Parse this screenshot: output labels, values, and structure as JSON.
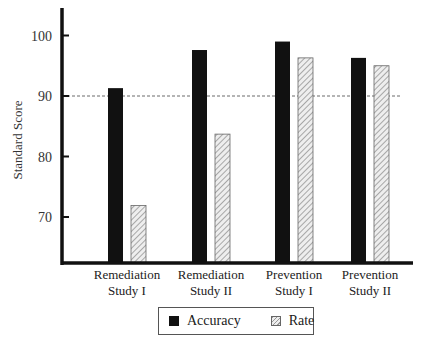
{
  "chart_data": {
    "type": "bar",
    "title": "",
    "xlabel": "",
    "ylabel": "Standard Score",
    "ylim": [
      62,
      104
    ],
    "yticks": [
      70,
      80,
      90,
      100
    ],
    "reference_line": {
      "value": 90,
      "style": "dashed"
    },
    "categories": [
      "Remediation Study I",
      "Remediation Study II",
      "Prevention Study I",
      "Prevention Study II"
    ],
    "category_lines": [
      [
        "Remediation",
        "Study I"
      ],
      [
        "Remediation",
        "Study II"
      ],
      [
        "Prevention",
        "Study I"
      ],
      [
        "Prevention",
        "Study II"
      ]
    ],
    "series": [
      {
        "name": "Accuracy",
        "values": [
          91.3,
          97.6,
          99.0,
          96.3
        ],
        "color": "#111111",
        "fill": "solid"
      },
      {
        "name": "Rate",
        "values": [
          71.9,
          83.7,
          96.3,
          95.0
        ],
        "color": "#cccccc",
        "fill": "hatched"
      }
    ],
    "legend_position": "bottom",
    "grid": false
  },
  "legend": {
    "accuracy": "Accuracy",
    "rate": "Rate"
  },
  "axis": {
    "ylabel": "Standard Score"
  }
}
